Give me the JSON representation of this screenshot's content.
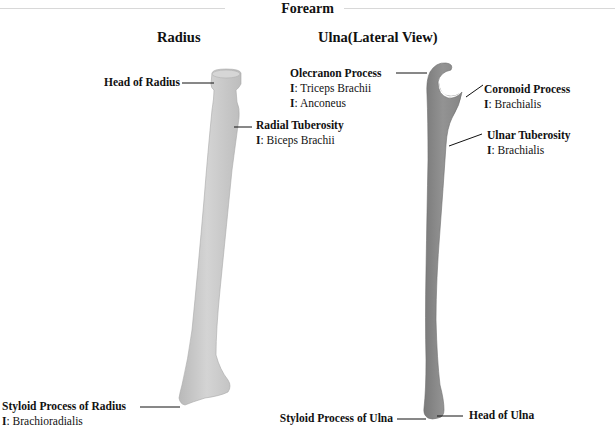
{
  "title": "Forearm",
  "columns": {
    "radius": "Radius",
    "ulna": "Ulna(Lateral View)"
  },
  "insertion_prefix": "I",
  "labels": {
    "head_of_radius": {
      "name": "Head of Radius"
    },
    "radial_tuberosity": {
      "name": "Radial Tuberosity",
      "insertions": [
        "Biceps Brachii"
      ]
    },
    "styloid_radius": {
      "name": "Styloid Process of Radius",
      "insertions": [
        "Brachioradialis"
      ]
    },
    "olecranon": {
      "name": "Olecranon Process",
      "insertions": [
        "Triceps Brachii",
        "Anconeus"
      ]
    },
    "coronoid": {
      "name": "Coronoid Process",
      "insertions": [
        "Brachialis"
      ]
    },
    "ulnar_tuberosity": {
      "name": "Ulnar Tuberosity",
      "insertions": [
        "Brachialis"
      ]
    },
    "styloid_ulna": {
      "name": "Styloid Process of Ulna"
    },
    "head_of_ulna": {
      "name": "Head of Ulna"
    }
  },
  "colors": {
    "radius_fill": "#c9c9c9",
    "ulna_fill": "#8e8e8e",
    "leader_line": "#111111"
  }
}
